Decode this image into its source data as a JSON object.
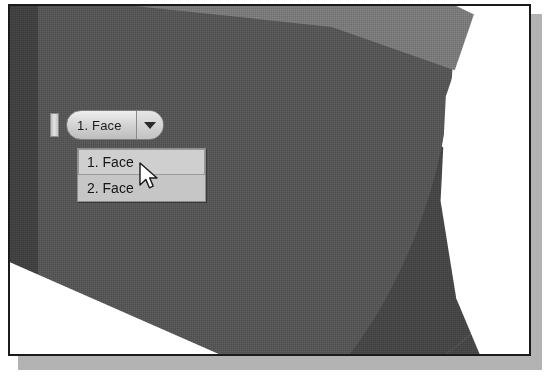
{
  "figure": {
    "kind": "cad-viewport-screenshot"
  },
  "viewport": {
    "model_name": "revolved-solid-shaded-view",
    "colors": {
      "solid_dark": "#464646",
      "solid_mid": "#565656",
      "solid_light": "#7a7a7a",
      "background": "#ffffff",
      "frame": "#1b1b1b",
      "shadow": "#b3b3b3"
    }
  },
  "selection_handle": {
    "name": "selection-grip"
  },
  "combo": {
    "value": "1. Face",
    "arrow_icon": "chevron-down-icon"
  },
  "dropdown": {
    "items": [
      {
        "label": "1. Face",
        "selected": true
      },
      {
        "label": "2. Face",
        "selected": false
      }
    ]
  },
  "cursor": {
    "type": "arrow-pointer"
  }
}
